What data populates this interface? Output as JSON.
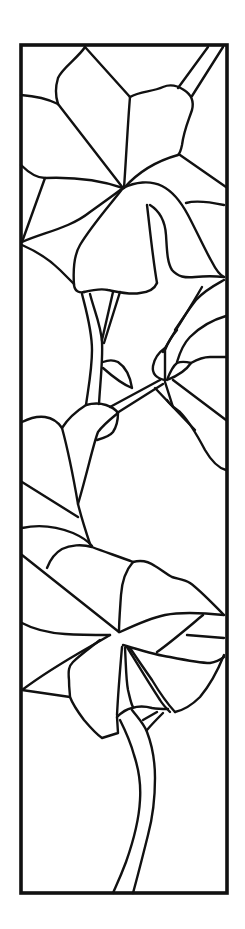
{
  "artwork": {
    "title": "Stained glass flower panel pattern",
    "line_color": "#111111",
    "background": "#ffffff",
    "frame": {
      "x": 21,
      "y": 45,
      "width": 206,
      "height": 848
    },
    "paths": [
      {
        "name": "top-flower-top-petal-left",
        "d": "M85 47 C78 58 62 68 58 78 C55 88 56 98 58 104"
      },
      {
        "name": "top-flower-top-petal-right",
        "d": "M85 47 L130 97"
      },
      {
        "name": "top-flower-top-petal-center",
        "d": "M58 104 L123 188"
      },
      {
        "name": "top-flower-right-petal-outline",
        "d": "M130 97 C140 91 152 92 163 87 C170 84 178 86 184 90 C192 95 194 102 192 110 C188 122 184 130 182 145 C181 150 180 153 178 155"
      },
      {
        "name": "top-flower-right-petal-spine",
        "d": "M130 97 C128 120 126 160 124 188"
      },
      {
        "name": "top-flower-right-petal-base",
        "d": "M178 155 C160 160 140 170 124 188"
      },
      {
        "name": "top-stem-1",
        "d": "M208 47 L178 88"
      },
      {
        "name": "top-stem-2",
        "d": "M223 47 L192 96"
      },
      {
        "name": "top-right-edge-line",
        "d": "M180 155 L226 187"
      },
      {
        "name": "left-petal-top",
        "d": "M21 95 C35 96 50 100 58 104"
      },
      {
        "name": "left-petal-bottom",
        "d": "M21 165 C28 172 36 178 45 178 C70 177 100 180 123 188"
      },
      {
        "name": "left-petal-lower-line",
        "d": "M45 178 L22 242"
      },
      {
        "name": "left-petal-to-center",
        "d": "M22 242 C45 232 70 228 90 212 C104 202 115 194 123 188"
      },
      {
        "name": "left-lower-curve",
        "d": "M22 245 C38 252 50 260 60 270 C66 276 70 280 74 284"
      },
      {
        "name": "bell-petal-left",
        "d": "M123 188 C110 205 92 225 80 245 C74 255 73 270 74 285 C75 292 80 293 84 292"
      },
      {
        "name": "bell-petal-bottom",
        "d": "M84 292 C92 290 100 288 108 290 C118 292 130 295 140 293 C150 292 155 288 157 283"
      },
      {
        "name": "bell-inner-line",
        "d": "M147 205 C150 230 153 260 157 283"
      },
      {
        "name": "bell-inner-line-2",
        "d": "M150 205 C158 210 165 220 166 235 C167 250 167 262 172 270 C178 277 185 278 195 277 C205 276 215 276 224 277"
      },
      {
        "name": "bell-right-fold",
        "d": "M123 188 C135 182 150 180 162 186 C172 191 180 200 188 215 C196 230 205 250 212 262 C216 270 220 275 224 277"
      },
      {
        "name": "bell-right-step",
        "d": "M186 203 C196 200 210 202 224 205"
      },
      {
        "name": "bell-right-low",
        "d": "M224 280 C215 285 205 290 196 300 C188 310 182 320 175 330"
      },
      {
        "name": "stem-a-left",
        "d": "M82 294 C86 310 92 330 92 350 C92 370 88 390 86 405"
      },
      {
        "name": "stem-a-right",
        "d": "M90 294 C94 310 101 325 102 342 C103 360 100 385 99 404"
      },
      {
        "name": "stem-b-left",
        "d": "M113 292 L102 340"
      },
      {
        "name": "stem-b-right",
        "d": "M120 292 L104 343"
      },
      {
        "name": "small-leaf",
        "d": "M103 362 C108 360 114 360 118 362 C124 366 130 375 132 388 M103 368 C112 376 122 384 132 388"
      },
      {
        "name": "stem-c-top",
        "d": "M110 407 L160 380"
      },
      {
        "name": "stem-c-bottom",
        "d": "M117 413 L163 384"
      },
      {
        "name": "bud-left",
        "d": "M165 348 C158 353 154 360 153 366 C152 373 155 378 165 380"
      },
      {
        "name": "bud-center",
        "d": "M165 378 L165 350 C168 342 172 336 177 330"
      },
      {
        "name": "bud-right-leaf",
        "d": "M167 380 C170 372 173 366 177 363 C182 361 187 362 191 363 C187 369 180 375 167 380"
      },
      {
        "name": "right-curve-up",
        "d": "M163 352 C172 335 186 315 202 287"
      },
      {
        "name": "right-curve-2",
        "d": "M177 362 C180 352 184 343 190 337 C200 327 212 320 226 316"
      },
      {
        "name": "right-curve-3",
        "d": "M191 363 C198 359 204 357 210 357 L226 357"
      },
      {
        "name": "right-line-long",
        "d": "M173 380 L226 420"
      },
      {
        "name": "right-line-mid",
        "d": "M165 382 L173 407 L195 430"
      },
      {
        "name": "right-line-small",
        "d": "M155 388 L173 407"
      },
      {
        "name": "right-curve-down",
        "d": "M167 400 C170 405 175 408 180 412 C188 420 196 433 205 450 C212 462 218 468 226 470"
      },
      {
        "name": "middle-leaf-left-outline",
        "d": "M22 422 C30 418 38 416 45 417 C52 418 58 422 62 428 C68 450 73 475 78 504 C82 520 86 532 90 544"
      },
      {
        "name": "middle-leaf-right-outline",
        "d": "M62 428 C67 420 75 412 86 405 C93 403 100 403 106 405 C112 407 116 410 118 413 C112 418 104 424 98 432 C93 445 88 470 78 504"
      },
      {
        "name": "middle-leaf-lobe",
        "d": "M97 440 C104 438 110 436 113 432 C117 426 118 418 118 413"
      },
      {
        "name": "middle-leaf-lower-line",
        "d": "M22 482 L78 517"
      },
      {
        "name": "middle-leaf-bottom-curve",
        "d": "M22 528 C40 524 58 527 73 533 C82 537 88 541 92 546"
      },
      {
        "name": "lower-flower-left-line",
        "d": "M22 555 L119 632"
      },
      {
        "name": "lower-flower-top-petal",
        "d": "M47 568 C50 560 55 553 62 549 C70 545 82 544 92 547 C105 552 120 557 133 562"
      },
      {
        "name": "lower-flower-top-right-petal",
        "d": "M133 562 C140 560 148 561 155 566 C162 570 166 574 172 577 C178 579 184 579 190 583 C200 590 212 603 224 615"
      },
      {
        "name": "lower-flower-center-spine",
        "d": "M133 562 C126 570 122 580 121 595 C120 610 119 622 119 632"
      },
      {
        "name": "lower-flower-left-petal",
        "d": "M22 623 C35 630 50 633 65 634 C80 635 95 635 110 635"
      },
      {
        "name": "lower-flower-right-petal",
        "d": "M120 632 C135 625 150 618 165 615 C180 612 195 612 224 615"
      },
      {
        "name": "lower-flower-right-inner",
        "d": "M157 652 C170 643 185 630 203 615"
      },
      {
        "name": "lower-flower-right-step",
        "d": "M187 635 L224 638"
      },
      {
        "name": "lower-flower-right-lower",
        "d": "M123 645 C140 650 155 655 170 657 C185 660 200 663 210 663 C216 662 220 660 224 657"
      },
      {
        "name": "lower-flower-right-petal-edge",
        "d": "M224 655 C218 670 210 685 200 697 C192 705 184 710 175 712"
      },
      {
        "name": "lower-flower-left-triangle",
        "d": "M110 635 C85 650 55 665 22 690 L70 697"
      },
      {
        "name": "lower-flower-left-petal-fold",
        "d": "M100 640 C90 648 80 655 73 662 C69 666 68 670 69 680 C69 688 70 694 70 697 C73 705 78 712 84 720 C90 727 96 734 102 738 L118 733 L117 717"
      },
      {
        "name": "lower-flower-spine-down",
        "d": "M122 647 C120 670 118 695 117 715"
      },
      {
        "name": "lower-flower-inner-1",
        "d": "M125 648 C126 665 126 680 128 690 C130 698 131 704 133 707"
      },
      {
        "name": "lower-flower-inner-2",
        "d": "M127 647 C138 665 150 685 160 700 C163 705 166 708 170 712"
      },
      {
        "name": "lower-flower-inner-3",
        "d": "M130 648 C138 660 145 670 152 680 C158 690 164 700 175 712"
      },
      {
        "name": "lower-stem-collar",
        "d": "M117 717 C122 712 127 709 132 708 C138 706 145 706 152 708 C158 709 163 709 168 709"
      },
      {
        "name": "lower-stem-side-1",
        "d": "M143 720 L157 712"
      },
      {
        "name": "lower-stem-side-2",
        "d": "M147 730 C152 724 158 718 163 713"
      },
      {
        "name": "lower-stem-left",
        "d": "M120 720 C125 730 130 740 134 755 C139 770 141 785 140 800 C139 820 132 845 126 862 C120 878 116 886 113 893"
      },
      {
        "name": "lower-stem-right",
        "d": "M132 710 C138 718 144 724 147 732 C152 745 155 760 155 778 C155 800 152 820 148 835 C143 855 138 875 133 893"
      }
    ]
  }
}
